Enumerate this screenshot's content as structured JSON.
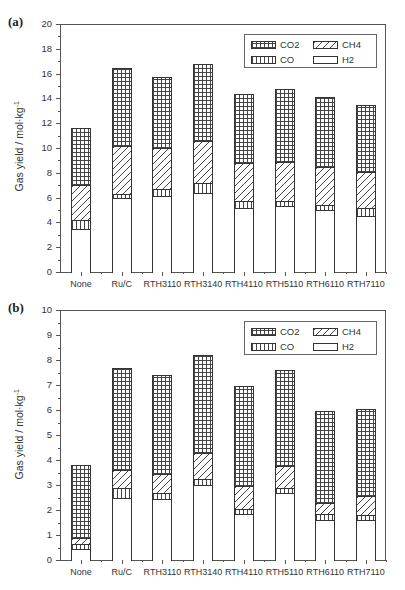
{
  "chart_data": [
    {
      "type": "bar",
      "stacked": true,
      "panel_label": "(a)",
      "title": "",
      "xlabel": "",
      "ylabel": "Gas yield / mol·kg⁻¹",
      "ylim": [
        0,
        20
      ],
      "yticks": [
        0,
        2,
        4,
        6,
        8,
        10,
        12,
        14,
        16,
        18,
        20
      ],
      "grid": false,
      "legend_position": "upper right",
      "categories": [
        "None",
        "Ru/C",
        "RTH3110",
        "RTH3140",
        "RTH4110",
        "RTH5110",
        "RTH6110",
        "RTH7110"
      ],
      "cumulative_tops": {
        "H2": [
          3.5,
          6.0,
          6.1,
          6.4,
          5.2,
          5.3,
          5.0,
          4.5
        ],
        "CO": [
          4.2,
          6.3,
          6.7,
          7.2,
          5.7,
          5.7,
          5.4,
          5.2
        ],
        "CH4": [
          7.0,
          10.2,
          10.0,
          10.6,
          8.8,
          8.9,
          8.5,
          8.1
        ],
        "CO2": [
          11.6,
          16.45,
          15.7,
          16.8,
          14.35,
          14.75,
          14.1,
          13.5
        ]
      },
      "series": [
        {
          "name": "H2",
          "pattern": "blank",
          "values": [
            3.5,
            6.0,
            6.1,
            6.4,
            5.2,
            5.3,
            5.0,
            4.5
          ]
        },
        {
          "name": "CO",
          "pattern": "vertical",
          "values": [
            0.7,
            0.3,
            0.6,
            0.8,
            0.5,
            0.4,
            0.4,
            0.7
          ]
        },
        {
          "name": "CH4",
          "pattern": "diagonal",
          "values": [
            2.8,
            3.9,
            3.3,
            3.4,
            3.1,
            3.2,
            3.1,
            2.9
          ]
        },
        {
          "name": "CO2",
          "pattern": "crosshatch",
          "values": [
            4.6,
            6.25,
            5.7,
            6.2,
            5.55,
            5.85,
            5.6,
            5.4
          ]
        }
      ]
    },
    {
      "type": "bar",
      "stacked": true,
      "panel_label": "(b)",
      "title": "",
      "xlabel": "",
      "ylabel": "Gas yield / mol·kg⁻¹",
      "ylim": [
        0,
        10
      ],
      "yticks": [
        0,
        1,
        2,
        3,
        4,
        5,
        6,
        7,
        8,
        9,
        10
      ],
      "grid": false,
      "legend_position": "upper right",
      "categories": [
        "None",
        "Ru/C",
        "RTH3110",
        "RTH3140",
        "RTH4110",
        "RTH5110",
        "RTH6110",
        "RTH7110"
      ],
      "cumulative_tops": {
        "H2": [
          0.45,
          2.5,
          2.45,
          3.0,
          1.85,
          2.7,
          1.6,
          1.6
        ],
        "CO": [
          0.65,
          2.9,
          2.7,
          3.25,
          2.05,
          2.9,
          1.85,
          1.8
        ],
        "CH4": [
          0.9,
          3.6,
          3.45,
          4.3,
          2.95,
          3.75,
          2.3,
          2.55
        ],
        "CO2": [
          3.8,
          7.7,
          7.4,
          8.2,
          6.95,
          7.6,
          5.95,
          6.05
        ]
      },
      "series": [
        {
          "name": "H2",
          "pattern": "blank",
          "values": [
            0.45,
            2.5,
            2.45,
            3.0,
            1.85,
            2.7,
            1.6,
            1.6
          ]
        },
        {
          "name": "CO",
          "pattern": "vertical",
          "values": [
            0.2,
            0.4,
            0.25,
            0.25,
            0.2,
            0.2,
            0.25,
            0.2
          ]
        },
        {
          "name": "CH4",
          "pattern": "diagonal",
          "values": [
            0.25,
            0.7,
            0.75,
            1.05,
            0.9,
            0.85,
            0.45,
            0.75
          ]
        },
        {
          "name": "CO2",
          "pattern": "crosshatch",
          "values": [
            2.9,
            4.1,
            3.95,
            3.9,
            4.0,
            3.85,
            3.65,
            3.5
          ]
        }
      ]
    }
  ],
  "panels": [
    {
      "label": "(a)",
      "ylabel": "Gas yield / mol·kg",
      "ylabel_sup": "-1",
      "ytick_labels": [
        "0",
        "2",
        "4",
        "6",
        "8",
        "10",
        "12",
        "14",
        "16",
        "18",
        "20"
      ],
      "legend": {
        "co2": "CO2",
        "ch4": "CH4",
        "co": "CO",
        "h2": "H2"
      }
    },
    {
      "label": "(b)",
      "ylabel": "Gas yield / mol·kg",
      "ylabel_sup": "-1",
      "ytick_labels": [
        "0",
        "1",
        "2",
        "3",
        "4",
        "5",
        "6",
        "7",
        "8",
        "9",
        "10"
      ],
      "legend": {
        "co2": "CO2",
        "ch4": "CH4",
        "co": "CO",
        "h2": "H2"
      }
    }
  ],
  "colors": {
    "axis": "#555555",
    "bar_edge": "#333333",
    "fill": "#ffffff"
  }
}
